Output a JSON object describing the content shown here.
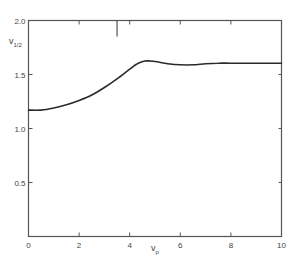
{
  "chart_data": {
    "type": "line",
    "title": "",
    "xlabel": "v_p",
    "ylabel": "v_1/2",
    "xlim": [
      0,
      10
    ],
    "ylim": [
      0,
      2.0
    ],
    "xticks": [
      0,
      2,
      4,
      6,
      8,
      10
    ],
    "xtick_labels": [
      "0",
      "2",
      "4",
      "6",
      "8",
      "10"
    ],
    "yticks": [
      0.5,
      1.0,
      1.5,
      2.0
    ],
    "ytick_labels": [
      "0.5",
      "1.0",
      "1.5",
      "2.0"
    ],
    "grid": false,
    "legend": null,
    "annotations": [
      {
        "type": "vertical-marker",
        "x": 3.5,
        "from_top": true,
        "note": "long tick from top axis"
      }
    ],
    "series": [
      {
        "name": "v_1/2",
        "x": [
          0,
          0.5,
          1.0,
          1.5,
          2.0,
          2.5,
          3.0,
          3.5,
          4.0,
          4.3,
          4.6,
          5.0,
          5.5,
          6.0,
          6.5,
          7.0,
          7.5,
          8.0,
          9.0,
          10.0
        ],
        "y": [
          1.17,
          1.17,
          1.19,
          1.22,
          1.26,
          1.31,
          1.38,
          1.46,
          1.55,
          1.6,
          1.625,
          1.62,
          1.6,
          1.59,
          1.59,
          1.6,
          1.605,
          1.605,
          1.605,
          1.605
        ]
      }
    ]
  },
  "labels": {
    "x_main": "v",
    "x_sub": "p",
    "y_main": "v",
    "y_sub": "1/2"
  }
}
